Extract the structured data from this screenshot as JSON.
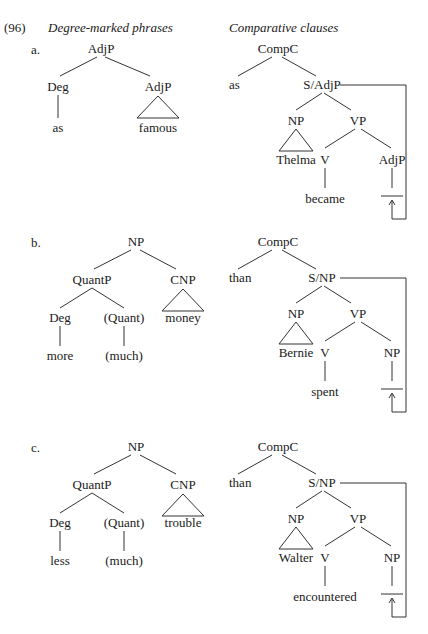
{
  "example_number": "(96)",
  "headings": {
    "left": "Degree-marked phrases",
    "right": "Comparative clauses"
  },
  "examples": [
    {
      "label": "a.",
      "degree_tree": {
        "root": "AdjP",
        "children": [
          {
            "label": "Deg",
            "leaf": "as"
          },
          {
            "label": "AdjP",
            "leaf": "famous",
            "triangle": true
          }
        ]
      },
      "comparative_tree": {
        "root": "CompC",
        "complementizer": "as",
        "slash": "S/AdjP",
        "subject": {
          "label": "NP",
          "leaf": "Thelma",
          "triangle": true
        },
        "vp": {
          "label": "VP",
          "verb": {
            "label": "V",
            "leaf": "became"
          },
          "gap": {
            "label": "AdjP",
            "leaf": ""
          }
        }
      }
    },
    {
      "label": "b.",
      "degree_tree": {
        "root": "NP",
        "quant_phrase": {
          "label": "QuantP",
          "children": [
            {
              "label": "Deg",
              "leaf": "more"
            },
            {
              "label": "(Quant)",
              "leaf": "(much)"
            }
          ]
        },
        "noun": {
          "label": "CNP",
          "leaf": "money",
          "triangle": true
        }
      },
      "comparative_tree": {
        "root": "CompC",
        "complementizer": "than",
        "slash": "S/NP",
        "subject": {
          "label": "NP",
          "leaf": "Bernie",
          "triangle": true
        },
        "vp": {
          "label": "VP",
          "verb": {
            "label": "V",
            "leaf": "spent"
          },
          "gap": {
            "label": "NP",
            "leaf": ""
          }
        }
      }
    },
    {
      "label": "c.",
      "degree_tree": {
        "root": "NP",
        "quant_phrase": {
          "label": "QuantP",
          "children": [
            {
              "label": "Deg",
              "leaf": "less"
            },
            {
              "label": "(Quant)",
              "leaf": "(much)"
            }
          ]
        },
        "noun": {
          "label": "CNP",
          "leaf": "trouble",
          "triangle": true
        }
      },
      "comparative_tree": {
        "root": "CompC",
        "complementizer": "than",
        "slash": "S/NP",
        "subject": {
          "label": "NP",
          "leaf": "Walter",
          "triangle": true
        },
        "vp": {
          "label": "VP",
          "verb": {
            "label": "V",
            "leaf": "encountered"
          },
          "gap": {
            "label": "NP",
            "leaf": ""
          }
        }
      }
    }
  ]
}
